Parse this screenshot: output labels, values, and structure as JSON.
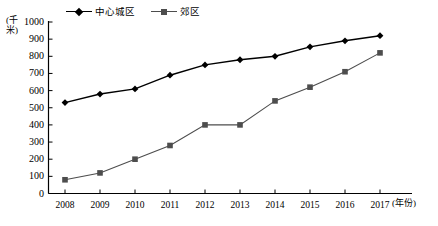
{
  "chart_data": {
    "type": "line",
    "title": "",
    "xlabel": "(年份)",
    "ylabel": "(千米)",
    "categories": [
      "2008",
      "2009",
      "2010",
      "2011",
      "2012",
      "2013",
      "2014",
      "2015",
      "2016",
      "2017"
    ],
    "series": [
      {
        "name": "中心城区",
        "marker": "diamond",
        "color": "#000000",
        "values": [
          530,
          580,
          610,
          690,
          750,
          780,
          800,
          855,
          890,
          920
        ]
      },
      {
        "name": "郊区",
        "marker": "square",
        "color": "#4d4d4d",
        "values": [
          80,
          120,
          200,
          280,
          400,
          400,
          540,
          620,
          710,
          820
        ]
      }
    ],
    "ylim": [
      0,
      1000
    ],
    "ytick_step": 100,
    "yticks": [
      "1000",
      "900",
      "800",
      "700",
      "600",
      "500",
      "400",
      "300",
      "200",
      "100",
      "0"
    ],
    "grid": false,
    "legend_position": "top-center"
  },
  "axes": {
    "y_unit_label": "(千米)",
    "x_unit_label": "(年份)"
  },
  "legend": {
    "entries": [
      {
        "label": "中心城区",
        "marker": "diamond-icon"
      },
      {
        "label": "郊区",
        "marker": "square-icon"
      }
    ]
  },
  "colors": {
    "axis": "#000000",
    "series_primary": "#000000",
    "series_secondary": "#4d4d4d",
    "background": "#ffffff"
  }
}
